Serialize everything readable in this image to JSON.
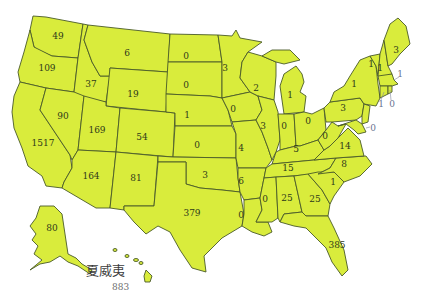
{
  "map": {
    "type": "choropleth-label-map",
    "region": "United States",
    "fill_color": "#d9ec3c",
    "border_color": "#4a5a28",
    "label_color": "#2f3a1a",
    "callout_label_color": "#6a7290"
  },
  "states": {
    "WA": {
      "name": "Washington",
      "value": "49"
    },
    "OR": {
      "name": "Oregon",
      "value": "109"
    },
    "CA": {
      "name": "California",
      "value": "1517"
    },
    "ID": {
      "name": "Idaho",
      "value": "37"
    },
    "NV": {
      "name": "Nevada",
      "value": "90"
    },
    "MT": {
      "name": "Montana",
      "value": "6"
    },
    "WY": {
      "name": "Wyoming",
      "value": "19"
    },
    "UT": {
      "name": "Utah",
      "value": "169"
    },
    "AZ": {
      "name": "Arizona",
      "value": "164"
    },
    "CO": {
      "name": "Colorado",
      "value": "54"
    },
    "NM": {
      "name": "New Mexico",
      "value": "81"
    },
    "ND": {
      "name": "North Dakota",
      "value": "0"
    },
    "SD": {
      "name": "South Dakota",
      "value": "0"
    },
    "NE": {
      "name": "Nebraska",
      "value": "1"
    },
    "KS": {
      "name": "Kansas",
      "value": "0"
    },
    "OK": {
      "name": "Oklahoma",
      "value": "3"
    },
    "TX": {
      "name": "Texas",
      "value": "379"
    },
    "MN": {
      "name": "Minnesota",
      "value": "3"
    },
    "IA": {
      "name": "Iowa",
      "value": "0"
    },
    "MO": {
      "name": "Missouri",
      "value": "4"
    },
    "AR": {
      "name": "Arkansas",
      "value": "6"
    },
    "LA": {
      "name": "Louisiana",
      "value": "0"
    },
    "WI": {
      "name": "Wisconsin",
      "value": "2"
    },
    "IL": {
      "name": "Illinois",
      "value": "3"
    },
    "MI": {
      "name": "Michigan",
      "value": "1"
    },
    "IN": {
      "name": "Indiana",
      "value": "0"
    },
    "OH": {
      "name": "Ohio",
      "value": "0"
    },
    "KY": {
      "name": "Kentucky",
      "value": "5"
    },
    "TN": {
      "name": "Tennessee",
      "value": "15"
    },
    "MS": {
      "name": "Mississippi",
      "value": "0"
    },
    "AL": {
      "name": "Alabama",
      "value": "25"
    },
    "GA": {
      "name": "Georgia",
      "value": "25"
    },
    "FL": {
      "name": "Florida",
      "value": "385"
    },
    "SC": {
      "name": "South Carolina",
      "value": "1"
    },
    "NC": {
      "name": "North Carolina",
      "value": "8"
    },
    "VA": {
      "name": "Virginia",
      "value": "14"
    },
    "WV": {
      "name": "West Virginia",
      "value": "0"
    },
    "PA": {
      "name": "Pennsylvania",
      "value": "3"
    },
    "NY": {
      "name": "New York",
      "value": "1"
    },
    "VT": {
      "name": "Vermont",
      "value": "1"
    },
    "NH": {
      "name": "New Hampshire",
      "value": "1"
    },
    "ME": {
      "name": "Maine",
      "value": "3"
    },
    "MA": {
      "name": "Massachusetts",
      "value": "1"
    },
    "CT": {
      "name": "Connecticut",
      "value": "1"
    },
    "RI": {
      "name": "Rhode Island",
      "value": "0"
    },
    "NJ_DE_MD": {
      "name": "Mid-Atlantic callout",
      "value": "0"
    },
    "AK": {
      "name": "Alaska",
      "value": "80"
    },
    "HI": {
      "name": "夏威夷",
      "value": "883"
    }
  },
  "hawaii_label": {
    "title": "夏威夷",
    "value": "883"
  }
}
